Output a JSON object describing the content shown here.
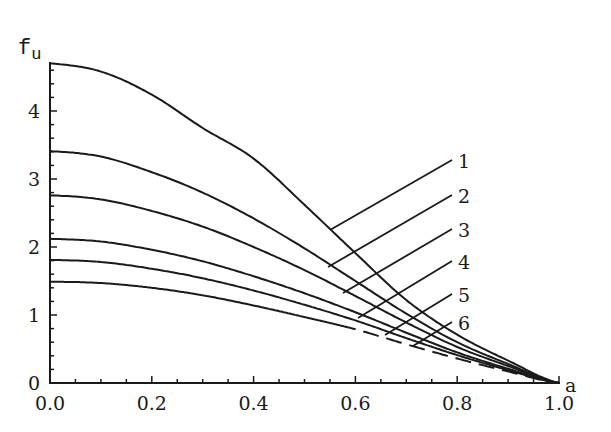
{
  "chart_data": {
    "type": "line",
    "title": "",
    "xlabel": "a",
    "ylabel": "f_u",
    "xlim": [
      0,
      1.0
    ],
    "ylim": [
      0,
      4.7
    ],
    "x_ticks": [
      "0.0",
      "0.2",
      "0.4",
      "0.6",
      "0.8",
      "1.0"
    ],
    "y_ticks": [
      "0",
      "1",
      "2",
      "3",
      "4"
    ],
    "grid": false,
    "legend_position": "inline leader-line labels at right",
    "x": [
      0.0,
      0.1,
      0.2,
      0.3,
      0.4,
      0.5,
      0.6,
      0.7,
      0.8,
      0.9,
      1.0
    ],
    "series": [
      {
        "name": "1",
        "values": [
          4.7,
          4.58,
          4.24,
          3.75,
          3.3,
          2.62,
          1.91,
          1.22,
          0.71,
          0.33,
          0.0
        ],
        "style": "solid"
      },
      {
        "name": "2",
        "values": [
          3.41,
          3.33,
          3.1,
          2.8,
          2.42,
          1.98,
          1.5,
          1.02,
          0.6,
          0.28,
          0.0
        ],
        "style": "solid"
      },
      {
        "name": "3",
        "values": [
          2.76,
          2.7,
          2.53,
          2.3,
          2.0,
          1.66,
          1.28,
          0.89,
          0.53,
          0.25,
          0.0
        ],
        "style": "solid"
      },
      {
        "name": "4",
        "values": [
          2.12,
          2.08,
          1.96,
          1.79,
          1.57,
          1.32,
          1.04,
          0.74,
          0.45,
          0.21,
          0.0
        ],
        "style": "solid"
      },
      {
        "name": "5",
        "values": [
          1.81,
          1.78,
          1.68,
          1.54,
          1.36,
          1.15,
          0.92,
          0.66,
          0.41,
          0.19,
          0.0
        ],
        "style": "solid"
      },
      {
        "name": "6",
        "values": [
          1.49,
          1.47,
          1.4,
          1.29,
          1.14,
          0.97,
          0.79,
          0.57,
          0.36,
          0.17,
          0.0
        ],
        "style": "solid-then-dashed (dashed from a≈0.57)"
      }
    ]
  },
  "axes": {
    "y_title": "f",
    "y_title_sub": "u",
    "x_title": "a"
  },
  "labels": [
    "1",
    "2",
    "3",
    "4",
    "5",
    "6"
  ]
}
